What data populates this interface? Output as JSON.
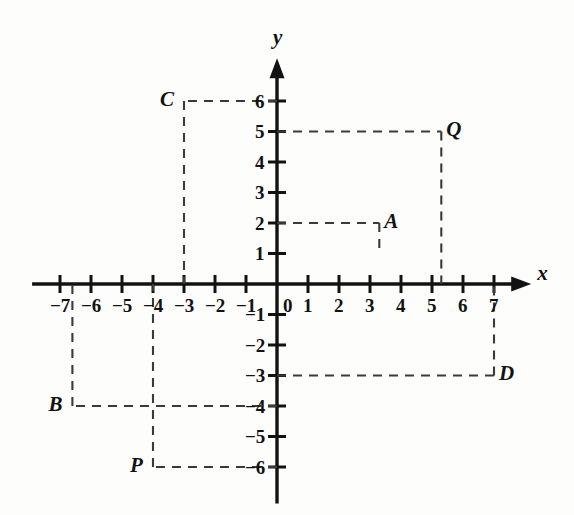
{
  "figure": {
    "type": "coordinate-plane",
    "background_color": "#fdfdfc",
    "ink_color": "#121212",
    "axis_labels": {
      "x": "x",
      "y": "y"
    },
    "origin_label": "0",
    "origin_px": {
      "x": 277,
      "y": 284
    },
    "unit_px": {
      "x": 31.0,
      "y": 30.5
    },
    "axis_ranges": {
      "x": [
        -7.9,
        8.2
      ],
      "y": [
        -7.2,
        7.4
      ]
    },
    "x_tick_labels": [
      "-7",
      "-6",
      "-5",
      "-4",
      "-3",
      "-2",
      "-1",
      "1",
      "2",
      "3",
      "4",
      "5",
      "6",
      "7"
    ],
    "x_tick_values": [
      -7,
      -6,
      -5,
      -4,
      -3,
      -2,
      -1,
      1,
      2,
      3,
      4,
      5,
      6,
      7
    ],
    "y_tick_labels": [
      "6",
      "5",
      "4",
      "3",
      "2",
      "1",
      "-1",
      "-2",
      "-3",
      "-4",
      "-5",
      "-6"
    ],
    "y_tick_values": [
      6,
      5,
      4,
      3,
      2,
      1,
      -1,
      -2,
      -3,
      -4,
      -5,
      -6
    ],
    "points": [
      {
        "label": "C",
        "x": -3,
        "y": 6,
        "label_side": "left",
        "guides": [
          "to-y-axis",
          "to-x-axis"
        ]
      },
      {
        "label": "Q",
        "x": 5.3,
        "y": 5,
        "label_side": "right",
        "guides": [
          "to-y-axis",
          "to-x-axis"
        ]
      },
      {
        "label": "A",
        "x": 3.3,
        "y": 2,
        "label_side": "right",
        "guides": [
          "to-y-axis",
          "stub-down"
        ]
      },
      {
        "label": "D",
        "x": 7,
        "y": -3,
        "label_side": "right",
        "guides": [
          "to-y-axis",
          "to-x-axis"
        ]
      },
      {
        "label": "B",
        "x": -6.6,
        "y": -4,
        "label_side": "left",
        "guides": [
          "to-y-axis",
          "to-x-axis"
        ]
      },
      {
        "label": "P",
        "x": -4,
        "y": -6,
        "label_side": "left",
        "guides": [
          "to-y-axis",
          "to-x-axis"
        ]
      }
    ]
  }
}
